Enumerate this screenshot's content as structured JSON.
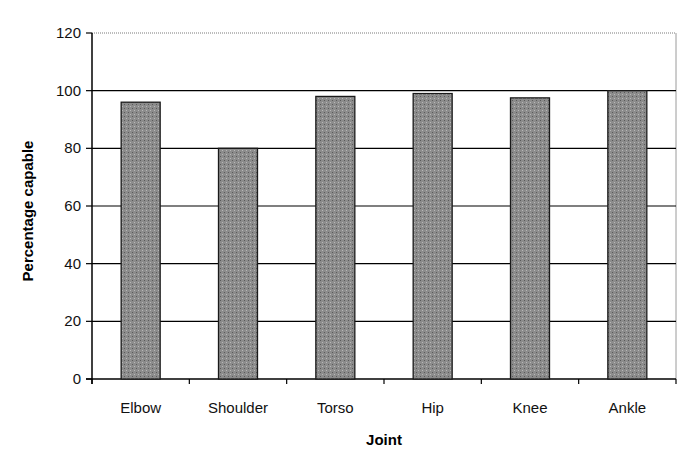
{
  "chart_data": {
    "type": "bar",
    "title": "",
    "xlabel": "Joint",
    "ylabel": "Percentage capable",
    "categories": [
      "Elbow",
      "Shoulder",
      "Torso",
      "Hip",
      "Knee",
      "Ankle"
    ],
    "values": [
      96,
      80,
      98,
      99,
      97.5,
      100
    ],
    "ylim": [
      0,
      120
    ],
    "yticks": [
      0,
      20,
      40,
      60,
      80,
      100,
      120
    ],
    "grid": true,
    "legend": null
  },
  "style": {
    "bar_fill": "#8c8c8c",
    "bar_stroke": "#1a1a1a",
    "grid_color": "#000000",
    "top_grid_color": "#7a7a7a",
    "plot_border_color": "#9a9a9a",
    "axis_color": "#000000"
  }
}
